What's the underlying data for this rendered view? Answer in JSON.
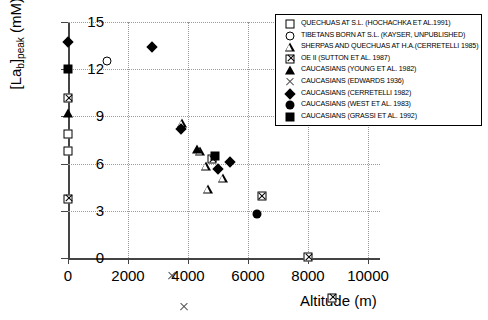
{
  "chart_data": {
    "type": "scatter",
    "title": "",
    "xlabel": "Altitude (m)",
    "ylabel": "[La_b]_peak (mM)",
    "ylabel_main": "[La",
    "ylabel_sub": "b",
    "ylabel_rest": "]",
    "ylabel_sub2": "peak",
    "ylabel_unit": "(mM)",
    "xlim": [
      0,
      10400
    ],
    "ylim": [
      0,
      15
    ],
    "xticks": [
      0,
      2000,
      4000,
      6000,
      8000,
      10000
    ],
    "yticks": [
      0,
      3,
      6,
      9,
      12,
      15
    ],
    "grid": "dotted",
    "legend_position": "top-right",
    "series": [
      {
        "name": "QUECHUAS AT S.L. (HOCHACHKA ET AL.1991)",
        "marker": "open-square",
        "points": [
          [
            0,
            7.9
          ],
          [
            0,
            6.8
          ]
        ]
      },
      {
        "name": "TIBETANS BORN AT S.L. (KAYSER, UNPUBLISHED)",
        "marker": "open-circle",
        "points": [
          [
            1300,
            12.5
          ]
        ]
      },
      {
        "name": "SHERPAS AND QUECHUAS  AT H.A.(CERRETELLI 1985)",
        "marker": "open-triangle",
        "points": [
          [
            3800,
            8.6
          ],
          [
            4400,
            7.4
          ],
          [
            4600,
            7.0
          ],
          [
            4650,
            6.1
          ],
          [
            5150,
            7.4
          ]
        ]
      },
      {
        "name": "OE II (SUTTON  ET AL.  1987)",
        "marker": "crossed-square",
        "points": [
          [
            0,
            13.0
          ],
          [
            0,
            7.2
          ],
          [
            4800,
            10.3
          ],
          [
            6450,
            8.5
          ],
          [
            8000,
            5.2
          ],
          [
            8800,
            3.2
          ]
        ]
      },
      {
        "name": "CAUCASIANS (YOUNG ET AL. 1982)",
        "marker": "filled-triangle",
        "points": [
          [
            0,
            9.2
          ],
          [
            4300,
            6.9
          ]
        ]
      },
      {
        "name": "CAUCASIANS (EDWARDS  1936)",
        "marker": "cross-x",
        "points": [
          [
            3450,
            5.2
          ],
          [
            3850,
            3.85
          ],
          [
            4700,
            2.35
          ],
          [
            5250,
            1.65
          ]
        ]
      },
      {
        "name": "CAUCASIANS (CERRETELLI 1982)",
        "marker": "filled-diamond",
        "points": [
          [
            0,
            13.7
          ],
          [
            2800,
            13.4
          ],
          [
            3750,
            8.2
          ],
          [
            5000,
            5.65
          ],
          [
            5400,
            6.1
          ]
        ]
      },
      {
        "name": "CAUCASIANS (WEST ET AL. 1983)",
        "marker": "filled-circle",
        "points": [
          [
            6300,
            2.8
          ]
        ]
      },
      {
        "name": "CAUCASIANS (GRASSI ET AL. 1992)",
        "marker": "filled-square",
        "points": [
          [
            0,
            12.0
          ],
          [
            4900,
            6.5
          ]
        ]
      }
    ]
  }
}
